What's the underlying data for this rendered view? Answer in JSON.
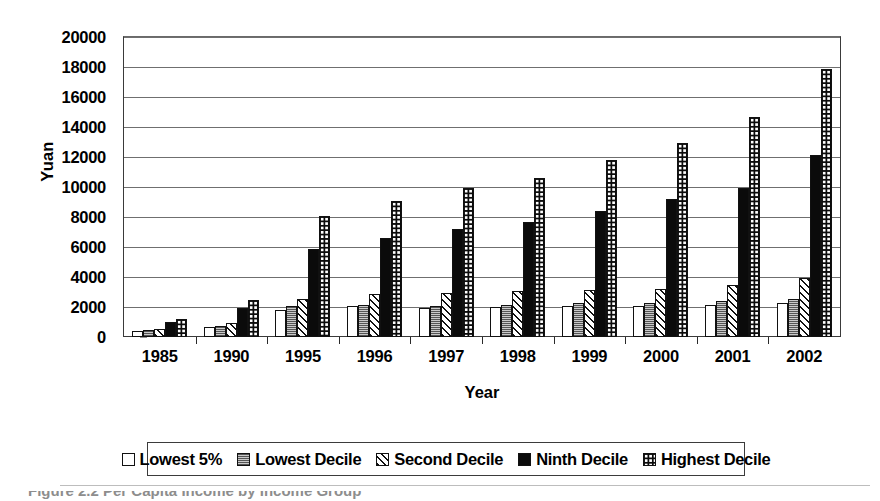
{
  "chart_data": {
    "type": "bar",
    "title": "",
    "xlabel": "Year",
    "ylabel": "Yuan",
    "ylim": [
      0,
      20000
    ],
    "ytick_step": 2000,
    "yticks": [
      0,
      2000,
      4000,
      6000,
      8000,
      10000,
      12000,
      14000,
      16000,
      18000,
      20000
    ],
    "grid": true,
    "legend_position": "bottom",
    "categories": [
      "1985",
      "1990",
      "1995",
      "1996",
      "1997",
      "1998",
      "1999",
      "2000",
      "2001",
      "2002"
    ],
    "series": [
      {
        "name": "Lowest 5%",
        "pattern": "solid-white",
        "values": [
          400,
          650,
          1800,
          2050,
          1950,
          1980,
          2100,
          2050,
          2150,
          2250
        ]
      },
      {
        "name": "Lowest Decile",
        "pattern": "fine-grey-dots",
        "values": [
          450,
          720,
          2050,
          2150,
          2100,
          2150,
          2250,
          2250,
          2400,
          2550
        ]
      },
      {
        "name": "Second Decile",
        "pattern": "diagonal-hatch",
        "values": [
          550,
          950,
          2550,
          2900,
          2950,
          3050,
          3150,
          3200,
          3450,
          3950
        ]
      },
      {
        "name": "Ninth Decile",
        "pattern": "solid-black",
        "values": [
          1000,
          1950,
          5850,
          6600,
          7200,
          7650,
          8400,
          9200,
          9950,
          12150
        ]
      },
      {
        "name": "Highest Decile",
        "pattern": "black-with-white-dots",
        "values": [
          1200,
          2450,
          8050,
          9100,
          9950,
          10600,
          11800,
          12950,
          14700,
          17850
        ]
      }
    ]
  },
  "axis": {
    "y_title": "Yuan",
    "x_title": "Year"
  },
  "legend": {
    "items": [
      {
        "label": "Lowest 5%"
      },
      {
        "label": "Lowest Decile"
      },
      {
        "label": "Second Decile"
      },
      {
        "label": "Ninth Decile"
      },
      {
        "label": "Highest Decile"
      }
    ]
  },
  "caption": {
    "text": "Figure 2.2   Per Capita Income by Income Group"
  }
}
